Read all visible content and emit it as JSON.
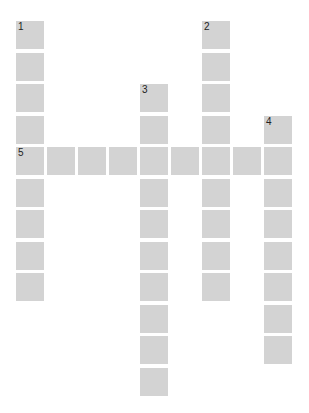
{
  "puzzle": {
    "type": "crossword",
    "layout": {
      "origin_x": 16,
      "origin_y": 21,
      "pitch_x": 31,
      "pitch_y": 31.5,
      "cell_size": 28,
      "cell_color": "#d3d3d3",
      "number_color": "#222222"
    },
    "entries": [
      {
        "number": "1",
        "direction": "down",
        "col": 0,
        "row": 0,
        "length": 9
      },
      {
        "number": "2",
        "direction": "down",
        "col": 6,
        "row": 0,
        "length": 9
      },
      {
        "number": "3",
        "direction": "down",
        "col": 4,
        "row": 2,
        "length": 10
      },
      {
        "number": "4",
        "direction": "down",
        "col": 8,
        "row": 3,
        "length": 8
      },
      {
        "number": "5",
        "direction": "across",
        "col": 0,
        "row": 4,
        "length": 9
      }
    ]
  }
}
